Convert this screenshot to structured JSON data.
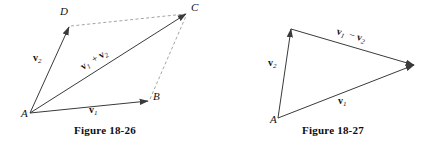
{
  "page": {
    "background_color": "#ffffff",
    "ink_color": "#3a3a3a",
    "dashed_color": "#9a9a9a",
    "width": 433,
    "height": 150
  },
  "figures": [
    {
      "id": "figure-18-26",
      "caption": "Figure  18-26",
      "caption_x": 105,
      "caption_y": 134,
      "description": "Parallelogram law of vector addition",
      "vertices": [
        {
          "name": "A",
          "label": "A",
          "x": 30,
          "y": 113,
          "label_x": 21,
          "label_y": 117
        },
        {
          "name": "B",
          "label": "B",
          "x": 148,
          "y": 101,
          "label_x": 153,
          "label_y": 100
        },
        {
          "name": "C",
          "label": "C",
          "x": 186,
          "y": 14,
          "label_x": 191,
          "label_y": 11
        },
        {
          "name": "D",
          "label": "D",
          "x": 69,
          "y": 27,
          "label_x": 60,
          "label_y": 15
        }
      ],
      "solid_vectors": [
        {
          "name": "vector-v1-AB",
          "from": "A",
          "to": "B",
          "x1": 30,
          "y1": 113,
          "x2": 148,
          "y2": 101
        },
        {
          "name": "vector-v2-AD",
          "from": "A",
          "to": "D",
          "x1": 30,
          "y1": 113,
          "x2": 69,
          "y2": 27
        },
        {
          "name": "vector-sum-AC",
          "from": "A",
          "to": "C",
          "x1": 30,
          "y1": 113,
          "x2": 186,
          "y2": 14
        }
      ],
      "dashed_edges": [
        {
          "name": "dashed-edge-DC",
          "from": "D",
          "to": "C",
          "x1": 71,
          "y1": 26,
          "x2": 185,
          "y2": 14
        },
        {
          "name": "dashed-edge-BC",
          "from": "B",
          "to": "C",
          "x1": 150,
          "y1": 99,
          "x2": 186,
          "y2": 16
        }
      ],
      "vector_labels": [
        {
          "name": "label-v2",
          "symbol": "v",
          "subscript": "2",
          "operator": "",
          "symbol2": "",
          "subscript2": "",
          "x": 33,
          "y": 61,
          "rotation": 0
        },
        {
          "name": "label-v1",
          "symbol": "v",
          "subscript": "1",
          "operator": "",
          "symbol2": "",
          "subscript2": "",
          "x": 89,
          "y": 113,
          "rotation": 0
        },
        {
          "name": "label-v1-plus-v2",
          "symbol": "v",
          "subscript": "1",
          "operator": "+",
          "symbol2": "v",
          "subscript2": "2",
          "x": 83,
          "y": 70,
          "rotation": -32
        }
      ]
    },
    {
      "id": "figure-18-27",
      "caption": "Figure  18-27",
      "caption_x": 333,
      "caption_y": 134,
      "description": "Triangle showing vector subtraction",
      "vertices": [
        {
          "name": "A",
          "label": "A",
          "x": 278,
          "y": 118,
          "label_x": 270,
          "label_y": 123
        },
        {
          "name": "T",
          "label": "",
          "x": 291,
          "y": 29,
          "label_x": 0,
          "label_y": 0
        },
        {
          "name": "R",
          "label": "",
          "x": 414,
          "y": 65,
          "label_x": 0,
          "label_y": 0
        }
      ],
      "solid_vectors": [
        {
          "name": "vector-v2-up",
          "from": "A",
          "to": "T",
          "x1": 278,
          "y1": 118,
          "x2": 291,
          "y2": 29
        },
        {
          "name": "vector-v1-diagonal",
          "from": "A",
          "to": "R",
          "x1": 278,
          "y1": 118,
          "x2": 414,
          "y2": 65
        },
        {
          "name": "vector-v1-minus-v2",
          "from": "T",
          "to": "R",
          "x1": 291,
          "y1": 29,
          "x2": 414,
          "y2": 65
        }
      ],
      "dashed_edges": [],
      "vector_labels": [
        {
          "name": "label-v2",
          "symbol": "v",
          "subscript": "2",
          "operator": "",
          "symbol2": "",
          "subscript2": "",
          "x": 268,
          "y": 66,
          "rotation": 0
        },
        {
          "name": "label-v1",
          "symbol": "v",
          "subscript": "1",
          "operator": "",
          "symbol2": "",
          "subscript2": "",
          "x": 338,
          "y": 104,
          "rotation": 0
        },
        {
          "name": "label-v1-minus-v2",
          "symbol": "v",
          "subscript": "1",
          "operator": "−",
          "symbol2": "v",
          "subscript2": "2",
          "x": 336,
          "y": 34,
          "rotation": 16
        }
      ]
    }
  ]
}
